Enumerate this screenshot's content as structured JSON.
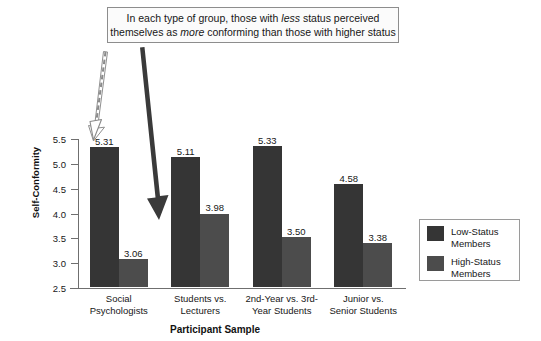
{
  "callout": {
    "line1_before": "In each type of group, those with ",
    "line1_em": "less",
    "line1_after": " status perceived",
    "line2_before": "themselves as ",
    "line2_em": "more",
    "line2_after": " conforming than those with higher status"
  },
  "arrows": {
    "dashed_arrow_name": "dashed-arrow-to-low-status-bar",
    "solid_arrow_name": "solid-arrow-to-high-status-bar"
  },
  "chart_data": {
    "type": "bar",
    "title": "",
    "xlabel": "Participant Sample",
    "ylabel": "Self-Conformity",
    "ylim": [
      2.5,
      5.5
    ],
    "ytick_step": 0.5,
    "yticks": [
      "5.5",
      "5.0",
      "4.5",
      "4.0",
      "3.5",
      "3.0",
      "2.5"
    ],
    "grid": false,
    "legend_position": "right",
    "categories": [
      "Social\nPsychologists",
      "Students vs.\nLecturers",
      "2nd-Year vs. 3rd-\nYear Students",
      "Junior vs.\nSenior Students"
    ],
    "series": [
      {
        "name": "Low-Status\nMembers",
        "color": "#353535",
        "values": [
          5.31,
          5.11,
          5.33,
          4.58
        ],
        "labels": [
          "5.31",
          "5.11",
          "5.33",
          "4.58"
        ]
      },
      {
        "name": "High-Status\nMembers",
        "color": "#4c4c4c",
        "values": [
          3.06,
          3.98,
          3.5,
          3.38
        ],
        "labels": [
          "3.06",
          "3.98",
          "3.50",
          "3.38"
        ]
      }
    ]
  }
}
